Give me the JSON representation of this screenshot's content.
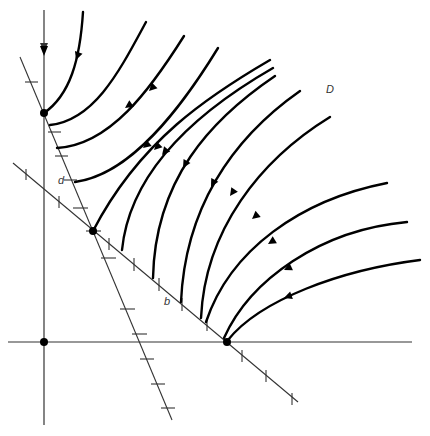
{
  "diagram": {
    "type": "phase-portrait",
    "labels": {
      "region": "D",
      "point_d": "d",
      "point_b": "b"
    },
    "colors": {
      "ink": "#000000",
      "axis": "#333333",
      "background": "#ffffff"
    },
    "points": [
      {
        "name": "origin",
        "x": 44,
        "y": 342
      },
      {
        "name": "y-axis-equilibrium",
        "x": 44,
        "y": 113
      },
      {
        "name": "intersection-equilibrium",
        "x": 93,
        "y": 231
      },
      {
        "name": "x-axis-equilibrium",
        "x": 227,
        "y": 342
      }
    ]
  }
}
